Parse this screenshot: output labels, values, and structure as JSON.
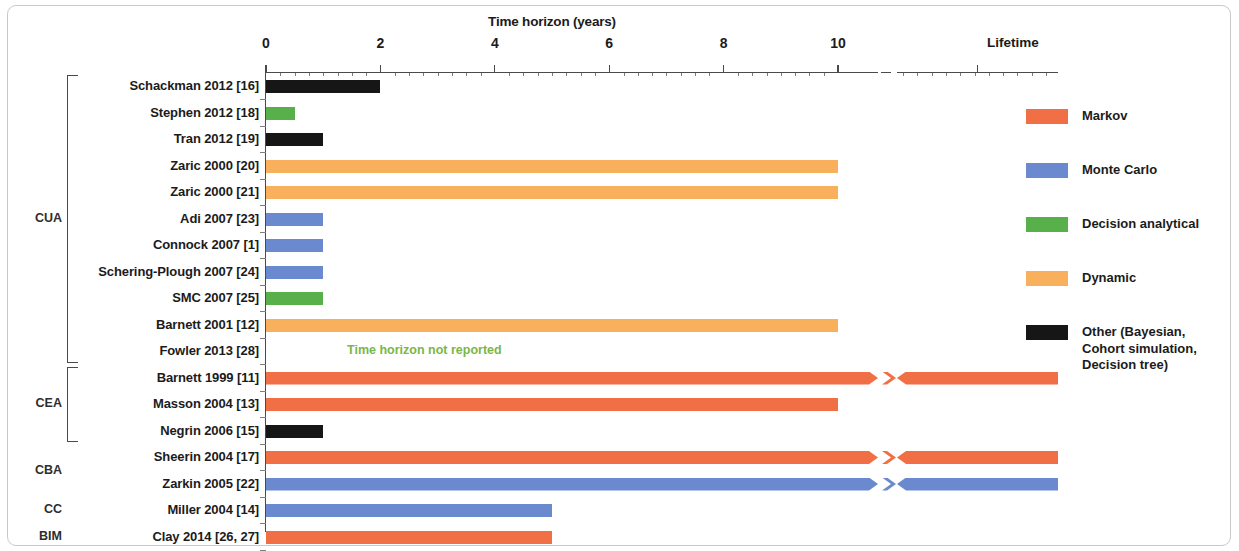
{
  "chart_data": {
    "type": "bar",
    "orientation": "horizontal",
    "title": "Time horizon (years)",
    "xlabel": "Time horizon (years)",
    "ylabel": "",
    "xlim": [
      0,
      11
    ],
    "grid": false,
    "legend_position": "right",
    "axis_break": {
      "after": 10,
      "resumes_label": "Lifetime"
    },
    "tick_labels": [
      "0",
      "2",
      "4",
      "6",
      "8",
      "10",
      "Lifetime"
    ],
    "tick_values": [
      0,
      2,
      4,
      6,
      8,
      10,
      "Lifetime"
    ],
    "categories": [
      "Schackman 2012 [16]",
      "Stephen 2012 [18]",
      "Tran 2012 [19]",
      "Zaric 2000 [20]",
      "Zaric 2000 [21]",
      "Adi 2007 [23]",
      "Connock 2007 [1]",
      "Schering-Plough 2007 [24]",
      "SMC 2007 [25]",
      "Barnett 2001 [12]",
      "Fowler 2013 [28]",
      "Barnett 1999 [11]",
      "Masson 2004 [13]",
      "Negrin 2006 [15]",
      "Sheerin 2004 [17]",
      "Zarkin 2005  [22]",
      "Miller 2004 [14]",
      "Clay 2014 [26, 27]"
    ],
    "values": [
      2,
      0.5,
      1,
      10,
      10,
      1,
      1,
      1,
      1,
      10,
      null,
      "Lifetime",
      10,
      1,
      "Lifetime",
      "Lifetime",
      5,
      5
    ],
    "series": [
      {
        "name": "Markov",
        "color": "#F06F45"
      },
      {
        "name": "Monte Carlo",
        "color": "#6A89CE"
      },
      {
        "name": "Decision analytical",
        "color": "#57B04A"
      },
      {
        "name": "Dynamic",
        "color": "#F8B05C"
      },
      {
        "name": "Other (Bayesian, Cohort simulation, Decision tree)",
        "color": "#161616"
      }
    ],
    "annotations": [
      {
        "text": "Time horizon not reported",
        "row": "Fowler 2013 [28]",
        "color": "#7ab648"
      }
    ],
    "rows": [
      {
        "label": "Schackman 2012 [16]",
        "value": 2,
        "model": "Other",
        "color": "#161616",
        "lifetime": false,
        "group": "CUA"
      },
      {
        "label": "Stephen 2012 [18]",
        "value": 0.5,
        "model": "Decision analytical",
        "color": "#57B04A",
        "lifetime": false,
        "group": "CUA"
      },
      {
        "label": "Tran 2012 [19]",
        "value": 1,
        "model": "Other",
        "color": "#161616",
        "lifetime": false,
        "group": "CUA"
      },
      {
        "label": "Zaric 2000 [20]",
        "value": 10,
        "model": "Dynamic",
        "color": "#F8B05C",
        "lifetime": false,
        "group": "CUA"
      },
      {
        "label": "Zaric 2000 [21]",
        "value": 10,
        "model": "Dynamic",
        "color": "#F8B05C",
        "lifetime": false,
        "group": "CUA"
      },
      {
        "label": "Adi 2007 [23]",
        "value": 1,
        "model": "Monte Carlo",
        "color": "#6A89CE",
        "lifetime": false,
        "group": "CUA"
      },
      {
        "label": "Connock 2007 [1]",
        "value": 1,
        "model": "Monte Carlo",
        "color": "#6A89CE",
        "lifetime": false,
        "group": "CUA"
      },
      {
        "label": "Schering-Plough 2007 [24]",
        "value": 1,
        "model": "Monte Carlo",
        "color": "#6A89CE",
        "lifetime": false,
        "group": "CUA"
      },
      {
        "label": "SMC 2007 [25]",
        "value": 1,
        "model": "Decision analytical",
        "color": "#57B04A",
        "lifetime": false,
        "group": "CUA"
      },
      {
        "label": "Barnett 2001 [12]",
        "value": 10,
        "model": "Dynamic",
        "color": "#F8B05C",
        "lifetime": false,
        "group": "CUA"
      },
      {
        "label": "Fowler 2013 [28]",
        "value": null,
        "model": "",
        "color": "",
        "lifetime": false,
        "group": "CUA",
        "note": "Time horizon not reported"
      },
      {
        "label": "Barnett 1999 [11]",
        "value": "Lifetime",
        "model": "Markov",
        "color": "#F06F45",
        "lifetime": true,
        "group": "CEA"
      },
      {
        "label": "Masson 2004 [13]",
        "value": 10,
        "model": "Markov",
        "color": "#F06F45",
        "lifetime": false,
        "group": "CEA"
      },
      {
        "label": "Negrin 2006 [15]",
        "value": 1,
        "model": "Other",
        "color": "#161616",
        "lifetime": false,
        "group": "CEA"
      },
      {
        "label": "Sheerin 2004 [17]",
        "value": "Lifetime",
        "model": "Markov",
        "color": "#F06F45",
        "lifetime": true,
        "group": "CBA"
      },
      {
        "label": "Zarkin 2005  [22]",
        "value": "Lifetime",
        "model": "Monte Carlo",
        "color": "#6A89CE",
        "lifetime": true,
        "group": "CBA"
      },
      {
        "label": "Miller 2004 [14]",
        "value": 5,
        "model": "Monte Carlo",
        "color": "#6A89CE",
        "lifetime": false,
        "group": "CC"
      },
      {
        "label": "Clay 2014 [26, 27]",
        "value": 5,
        "model": "Markov",
        "color": "#F06F45",
        "lifetime": false,
        "group": "BIM"
      }
    ]
  },
  "axis": {
    "title": "Time horizon (years)",
    "ticks": [
      {
        "label": "0"
      },
      {
        "label": "2"
      },
      {
        "label": "4"
      },
      {
        "label": "6"
      },
      {
        "label": "8"
      },
      {
        "label": "10"
      },
      {
        "label": "Lifetime"
      }
    ]
  },
  "groups": [
    {
      "label": "CUA"
    },
    {
      "label": "CEA"
    },
    {
      "label": "CBA"
    },
    {
      "label": "CC"
    },
    {
      "label": "BIM"
    }
  ],
  "legend": {
    "items": [
      {
        "label": "Markov",
        "color": "#F06F45"
      },
      {
        "label": "Monte Carlo",
        "color": "#6A89CE"
      },
      {
        "label": "Decision analytical",
        "color": "#57B04A"
      },
      {
        "label": "Dynamic",
        "color": "#F8B05C"
      },
      {
        "label": "Other (Bayesian,\nCohort simulation,\nDecision tree)",
        "color": "#161616"
      }
    ]
  },
  "notes": {
    "not_reported": "Time horizon not reported",
    "not_reported_color": "#7ab648"
  }
}
